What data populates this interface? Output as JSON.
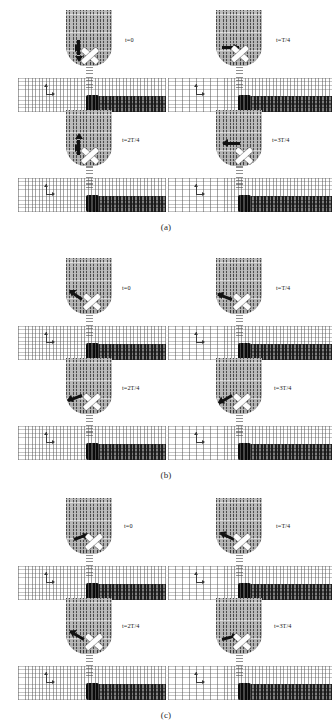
{
  "figure": {
    "kind": "micromagnetic-vector-field-snapshots",
    "panels": [
      {
        "caption": "(a)",
        "snapshots": [
          {
            "time_label": "t=0",
            "arrow_direction": "down",
            "arrow_angle_deg": 90,
            "position": "top-left"
          },
          {
            "time_label": "t=T/4",
            "arrow_direction": "right",
            "arrow_angle_deg": 0,
            "position": "top-right"
          },
          {
            "time_label": "t=2T/4",
            "arrow_direction": "up",
            "arrow_angle_deg": 270,
            "position": "bottom-left"
          },
          {
            "time_label": "t=3T/4",
            "arrow_direction": "left",
            "arrow_angle_deg": 180,
            "position": "bottom-right"
          }
        ]
      },
      {
        "caption": "(b)",
        "snapshots": [
          {
            "time_label": "t=0",
            "arrow_direction": "up-left",
            "arrow_angle_deg": 215,
            "position": "top-left"
          },
          {
            "time_label": "t=T/4",
            "arrow_direction": "up-left",
            "arrow_angle_deg": 200,
            "position": "top-right"
          },
          {
            "time_label": "t=2T/4",
            "arrow_direction": "down-left",
            "arrow_angle_deg": 160,
            "position": "bottom-left"
          },
          {
            "time_label": "t=3T/4",
            "arrow_direction": "down-left",
            "arrow_angle_deg": 150,
            "position": "bottom-right"
          }
        ]
      },
      {
        "caption": "(c)",
        "snapshots": [
          {
            "time_label": "t=0",
            "arrow_direction": "right",
            "arrow_angle_deg": 20,
            "position": "top-left"
          },
          {
            "time_label": "t=T/4",
            "arrow_direction": "up-left",
            "arrow_angle_deg": 205,
            "position": "top-right"
          },
          {
            "time_label": "t=2T/4",
            "arrow_direction": "up-left",
            "arrow_angle_deg": 210,
            "position": "bottom-left"
          },
          {
            "time_label": "t=3T/4",
            "arrow_direction": "right",
            "arrow_angle_deg": 15,
            "position": "bottom-right"
          }
        ]
      }
    ],
    "colors": {
      "background": "#ffffff",
      "tip_fill": "#b2b2b2",
      "strip_light": "#ffffff",
      "strip_dark": "#6e6e6e",
      "core_dark": "#3a3a3a",
      "marker_white": "#fdfdfd",
      "arrow_black": "#121212",
      "text": "#1a1a1a"
    }
  }
}
